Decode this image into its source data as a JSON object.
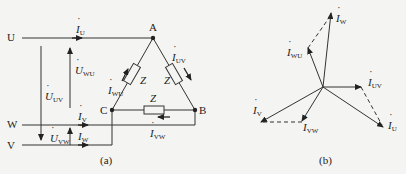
{
  "figure_a": {
    "caption": "(a)",
    "terminals": {
      "U": "U",
      "W": "W",
      "V": "V"
    },
    "nodes": {
      "A": "A",
      "B": "B",
      "C": "C"
    },
    "impedance_label": "Z",
    "currents": {
      "I_U": {
        "sym": "I",
        "sub": "U"
      },
      "I_V": {
        "sym": "I",
        "sub": "V"
      },
      "I_W": {
        "sym": "I",
        "sub": "W"
      },
      "I_UV": {
        "sym": "I",
        "sub": "UV"
      },
      "I_WU": {
        "sym": "I",
        "sub": "WU"
      },
      "I_VW": {
        "sym": "I",
        "sub": "VW"
      }
    },
    "voltages": {
      "U_UV": {
        "sym": "U",
        "sub": "UV"
      },
      "U_WU": {
        "sym": "U",
        "sub": "WU"
      },
      "U_VW": {
        "sym": "U",
        "sub": "VW"
      }
    }
  },
  "figure_b": {
    "caption": "(b)",
    "phasors": {
      "I_W": {
        "sym": "I",
        "sub": "W"
      },
      "I_WU": {
        "sym": "I",
        "sub": "WU"
      },
      "I_UV": {
        "sym": "I",
        "sub": "UV"
      },
      "I_U": {
        "sym": "I",
        "sub": "U"
      },
      "I_V": {
        "sym": "I",
        "sub": "V"
      },
      "I_VW": {
        "sym": "I",
        "sub": "VW"
      }
    }
  }
}
